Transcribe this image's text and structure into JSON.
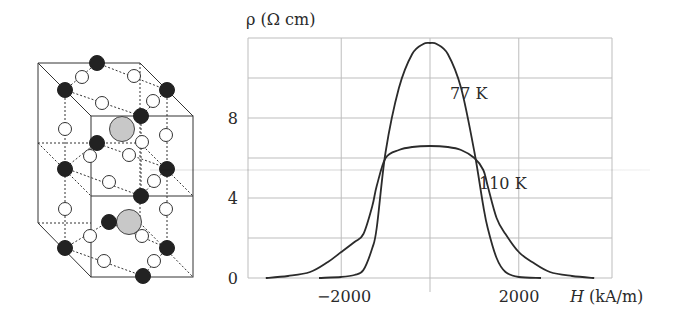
{
  "figure": {
    "crystal": {
      "description": "Perovskite-type unit cell: two stacked cubes, black and white spheres with dashed bonds, two large gray central spheres",
      "sphere_colors": {
        "black": "#222222",
        "white": "#ffffff",
        "gray": "#c8c8c8"
      }
    },
    "chart": {
      "ylabel": "ρ (Ω cm)",
      "xlabel_var": "H",
      "xlabel_unit": " (kA/m)",
      "yticks": [
        "0",
        "4",
        "8"
      ],
      "xticks": [
        "−2000",
        "2000"
      ],
      "labels": {
        "s77": "77 K",
        "s110": "110 K"
      }
    }
  },
  "chart_data": {
    "type": "line",
    "title": "",
    "xlabel": "H (kA/m)",
    "ylabel": "ρ (Ω cm)",
    "xlim": [
      -4100,
      4100
    ],
    "ylim": [
      0,
      12
    ],
    "xticks": [
      -2000,
      2000
    ],
    "yticks": [
      0,
      4,
      8
    ],
    "grid": {
      "x": [
        -4100,
        -2000,
        0,
        2000,
        4100
      ],
      "y": [
        0,
        2,
        4,
        6,
        8,
        10,
        12
      ]
    },
    "legend": "inline annotations",
    "series": [
      {
        "name": "77 K",
        "x": [
          -2500,
          -2000,
          -1700,
          -1500,
          -1300,
          -1200,
          -1000,
          -700,
          -400,
          -150,
          0,
          150,
          400,
          700,
          1000,
          1200,
          1300,
          1500,
          1700,
          2000,
          2500
        ],
        "y": [
          0,
          0.05,
          0.15,
          0.4,
          1.5,
          2.5,
          6.3,
          9.5,
          11.2,
          11.7,
          11.75,
          11.7,
          11.2,
          9.5,
          6.3,
          3.6,
          2.5,
          1.0,
          0.3,
          0.05,
          0
        ]
      },
      {
        "name": "110 K",
        "x": [
          -3700,
          -3200,
          -2700,
          -2300,
          -2000,
          -1700,
          -1500,
          -1300,
          -1200,
          -1000,
          -700,
          -400,
          0,
          400,
          700,
          1000,
          1200,
          1300,
          1500,
          1700,
          2000,
          2300,
          2700,
          3200,
          3700
        ],
        "y": [
          0,
          0.1,
          0.3,
          0.8,
          1.3,
          1.8,
          2.2,
          3.6,
          4.6,
          6.0,
          6.4,
          6.55,
          6.6,
          6.55,
          6.4,
          6.0,
          5.4,
          4.6,
          3.0,
          2.2,
          1.3,
          0.8,
          0.3,
          0.1,
          0
        ]
      }
    ],
    "annotations": [
      {
        "text": "77 K",
        "x": 870,
        "y": 9.0
      },
      {
        "text": "110 K",
        "x": 1050,
        "y": 4.6
      }
    ]
  }
}
